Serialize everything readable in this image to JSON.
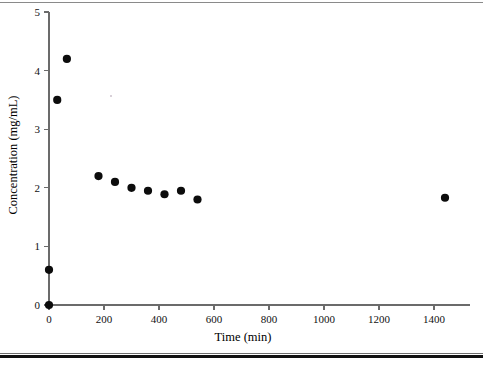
{
  "figure": {
    "background_color": "#ffffff",
    "marker_color": "#0c0c0c",
    "axis_color": "#6b6b6b",
    "top_rule_color": "#8a8a8a",
    "bottom_rule_color": "#111111"
  },
  "chart_data": {
    "type": "scatter",
    "title": "",
    "xlabel": "Time (min)",
    "ylabel": "Concentration (mg/mL)",
    "xlim": [
      0,
      1550
    ],
    "ylim": [
      0,
      5
    ],
    "xticks": [
      0,
      200,
      400,
      600,
      800,
      1000,
      1200,
      1400
    ],
    "xtick_labels": [
      "0",
      "200",
      "400",
      "600",
      "800",
      "1000",
      "1200",
      "1400"
    ],
    "yticks": [
      0,
      1,
      2,
      3,
      4,
      5
    ],
    "ytick_labels": [
      "0",
      "1",
      "2",
      "3",
      "4",
      "5"
    ],
    "grid": false,
    "legend": null,
    "series": [
      {
        "name": "Concentration",
        "marker": "circle",
        "color": "#0c0c0c",
        "points": [
          {
            "x": 0,
            "y": 0.0
          },
          {
            "x": 0,
            "y": 0.6
          },
          {
            "x": 30,
            "y": 3.5
          },
          {
            "x": 65,
            "y": 4.2
          },
          {
            "x": 180,
            "y": 2.2
          },
          {
            "x": 240,
            "y": 2.1
          },
          {
            "x": 300,
            "y": 2.0
          },
          {
            "x": 360,
            "y": 1.95
          },
          {
            "x": 420,
            "y": 1.89
          },
          {
            "x": 480,
            "y": 1.95
          },
          {
            "x": 540,
            "y": 1.8
          },
          {
            "x": 1440,
            "y": 1.83
          }
        ]
      }
    ]
  }
}
